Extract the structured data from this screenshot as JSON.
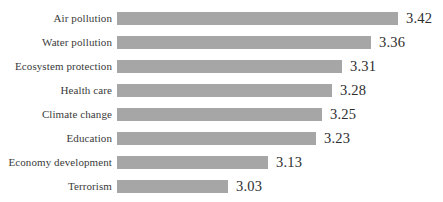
{
  "chart_data": {
    "type": "bar",
    "orientation": "horizontal",
    "title": "",
    "subtitle": "",
    "xlabel": "",
    "ylabel": "",
    "categories": [
      "Air pollution",
      "Water pollution",
      "Ecosystem protection",
      "Health care",
      "Climate change",
      "Education",
      "Economy development",
      "Terrorism"
    ],
    "values": [
      3.42,
      3.36,
      3.31,
      3.28,
      3.25,
      3.23,
      3.13,
      3.03
    ],
    "value_labels": [
      "3.42",
      "3.36",
      "3.31",
      "3.28",
      "3.25",
      "3.23",
      "3.13",
      "3.03"
    ],
    "series": [
      {
        "name": "",
        "values": [
          3.42,
          3.36,
          3.31,
          3.28,
          3.25,
          3.23,
          3.13,
          3.03
        ]
      }
    ],
    "xlim": [
      2.85,
      3.45
    ],
    "axis_origin": 2.85,
    "grid": false,
    "axis_visible": false,
    "tick_labels_x": [],
    "legend": null,
    "legend_position": "none",
    "data_labels_shown": true,
    "bar_color": "#a6a6a6",
    "label_color": "#3a3a3a",
    "value_color": "#2e2e2e",
    "background_color": "#ffffff"
  },
  "layout": {
    "plot_left": 117,
    "row_pitch": 24,
    "first_row_top": 7,
    "bar_height": 13,
    "bar_pixel_ends": [
      398,
      371,
      342,
      332,
      322,
      316,
      268,
      228
    ],
    "value_gap": 8
  }
}
